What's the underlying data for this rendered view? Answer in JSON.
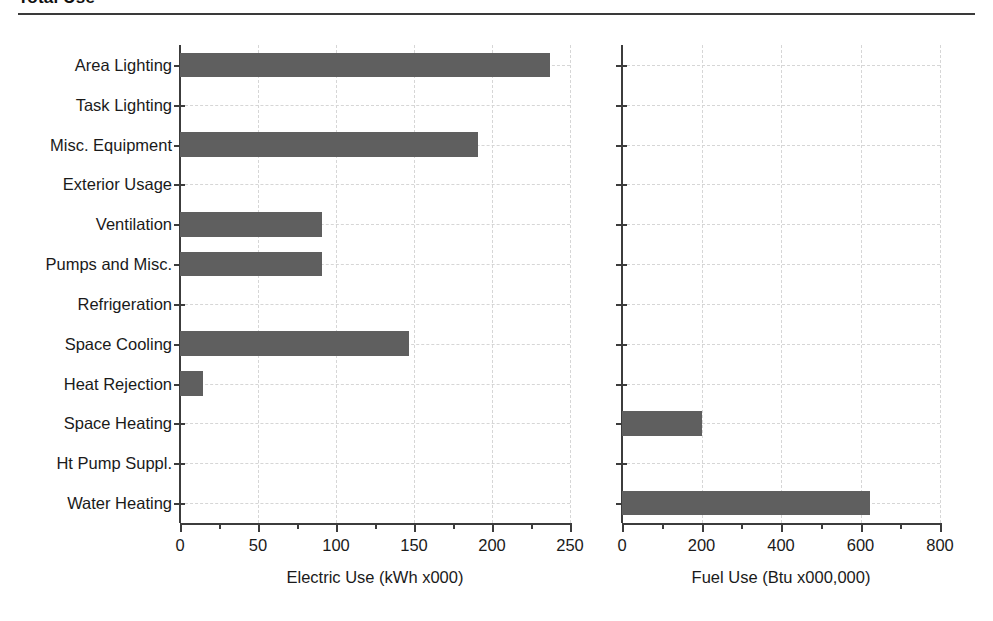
{
  "header": {
    "title": "Total Use",
    "rule": "horizontal-rule"
  },
  "chart_data": {
    "type": "bar",
    "orientation": "horizontal",
    "title": "Total Use",
    "categories": [
      "Area Lighting",
      "Task Lighting",
      "Misc. Equipment",
      "Exterior Usage",
      "Ventilation",
      "Pumps and Misc.",
      "Refrigeration",
      "Space Cooling",
      "Heat Rejection",
      "Space Heating",
      "Ht Pump Suppl.",
      "Water Heating"
    ],
    "panels": [
      {
        "name": "electric",
        "xlabel": "Electric Use (kWh x000)",
        "ylabel": "",
        "xlim": [
          0,
          250
        ],
        "xticks": [
          0,
          50,
          100,
          150,
          200,
          250
        ],
        "xticklabels": [
          "0",
          "50",
          "100",
          "150",
          "200",
          "250"
        ],
        "minor_tick_step": 25,
        "grid": true,
        "bar_color": "#5f5f5f",
        "values": [
          237,
          0,
          191,
          0,
          91,
          91,
          0,
          147,
          15,
          0,
          0,
          0
        ]
      },
      {
        "name": "fuel",
        "xlabel": "Fuel Use (Btu x000,000)",
        "ylabel": "",
        "xlim": [
          0,
          800
        ],
        "xticks": [
          0,
          200,
          400,
          600,
          800
        ],
        "xticklabels": [
          "0",
          "200",
          "400",
          "600",
          "800"
        ],
        "minor_tick_step": 100,
        "grid": true,
        "bar_color": "#5f5f5f",
        "values": [
          0,
          0,
          0,
          0,
          0,
          0,
          0,
          0,
          0,
          201,
          0,
          624
        ]
      }
    ],
    "legend": null,
    "gridline_color": "#d6d6d6",
    "axis_color": "#3c3c3c"
  }
}
